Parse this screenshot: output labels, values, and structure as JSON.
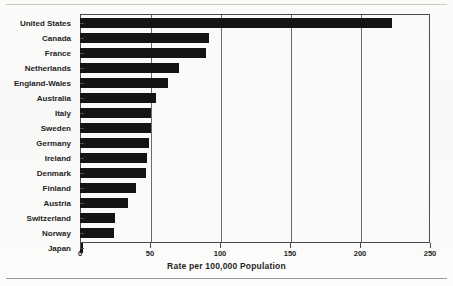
{
  "chart_data": {
    "type": "bar",
    "orientation": "horizontal",
    "title": "",
    "xlabel": "Rate per 100,000 Population",
    "ylabel": "",
    "xlim": [
      0,
      250
    ],
    "xticks": [
      0,
      50,
      100,
      150,
      200,
      250
    ],
    "grid": "vertical",
    "legend": "none",
    "categories": [
      "United States",
      "Canada",
      "France",
      "Netherlands",
      "England-Wales",
      "Australia",
      "Italy",
      "Sweden",
      "Germany",
      "Ireland",
      "Denmark",
      "Finland",
      "Austria",
      "Switzerland",
      "Norway",
      "Japan"
    ],
    "values": [
      223,
      92,
      90,
      71,
      63,
      54,
      51,
      51,
      49,
      48,
      47,
      40,
      34,
      25,
      24,
      2
    ],
    "bar_color": "#141414"
  },
  "axis": {
    "x_title": "Rate per 100,000 Population",
    "tick_labels": [
      "0",
      "50",
      "100",
      "150",
      "200",
      "250"
    ]
  }
}
